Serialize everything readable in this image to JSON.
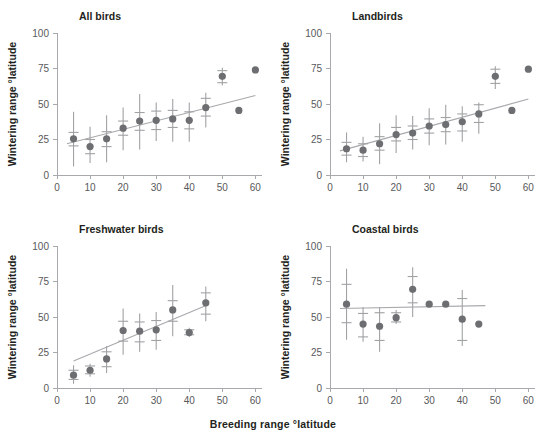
{
  "figure": {
    "x_axis_caption": "Breeding range °latitude",
    "y_axis_caption": "Wintering range °latitude",
    "marker_color": "#6d6e71",
    "errorbar_color": "#a0a2a4",
    "trendline_color": "#a7a9ac",
    "axis_color": "#a7a9ac"
  },
  "axes": {
    "x_ticks": [
      0,
      10,
      20,
      30,
      40,
      50,
      60
    ],
    "y_ticks": [
      0,
      25,
      50,
      75,
      100
    ],
    "xlim": [
      0,
      62
    ],
    "ylim": [
      0,
      100
    ],
    "grid": false
  },
  "chart_data": [
    {
      "type": "scatter",
      "title": "All birds",
      "xlabel": "Breeding range °latitude",
      "ylabel": "Wintering range °latitude",
      "xlim": [
        0,
        62
      ],
      "ylim": [
        0,
        100
      ],
      "x_ticks": [
        0,
        10,
        20,
        30,
        40,
        50,
        60
      ],
      "y_ticks": [
        0,
        25,
        50,
        75,
        100
      ],
      "grid": false,
      "legend": "none",
      "x": [
        5,
        10,
        15,
        20,
        25,
        30,
        35,
        40,
        45,
        50,
        55,
        60
      ],
      "y": [
        25.5,
        20.0,
        25.5,
        33.0,
        38.0,
        38.5,
        39.5,
        38.5,
        47.5,
        69.5,
        45.5,
        74.0
      ],
      "err_low": [
        6.0,
        8.5,
        9.0,
        17.5,
        18.0,
        24.0,
        23.5,
        23.5,
        33.5,
        63.0,
        null,
        null
      ],
      "err_high": [
        44.5,
        34.0,
        42.0,
        47.5,
        57.0,
        51.0,
        53.5,
        51.0,
        58.0,
        75.5,
        null,
        null
      ],
      "cap_low": [
        20.5,
        15.0,
        20.0,
        28.0,
        31.5,
        32.0,
        33.5,
        32.5,
        41.5,
        65.0,
        null,
        null
      ],
      "cap_high": [
        30.0,
        25.0,
        30.5,
        38.0,
        44.0,
        45.0,
        45.5,
        44.5,
        54.0,
        73.5,
        null,
        null
      ],
      "trendline": {
        "x0": 3.0,
        "y0": 22.0,
        "x1": 60.0,
        "y1": 56.0
      }
    },
    {
      "type": "scatter",
      "title": "Landbirds",
      "xlabel": "Breeding range °latitude",
      "ylabel": "Wintering range °latitude",
      "xlim": [
        0,
        62
      ],
      "ylim": [
        0,
        100
      ],
      "x_ticks": [
        0,
        10,
        20,
        30,
        40,
        50,
        60
      ],
      "y_ticks": [
        0,
        25,
        50,
        75,
        100
      ],
      "grid": false,
      "legend": "none",
      "x": [
        5,
        10,
        15,
        20,
        25,
        30,
        35,
        40,
        45,
        50,
        55,
        60
      ],
      "y": [
        18.5,
        17.5,
        22.0,
        28.5,
        29.5,
        34.5,
        35.5,
        37.5,
        43.0,
        69.5,
        45.5,
        74.5
      ],
      "err_low": [
        9.0,
        9.5,
        7.5,
        15.5,
        18.0,
        21.0,
        21.5,
        23.5,
        29.0,
        60.5,
        null,
        null
      ],
      "err_high": [
        30.0,
        27.0,
        36.5,
        42.0,
        41.5,
        47.0,
        49.5,
        48.5,
        51.0,
        76.5,
        null,
        null
      ],
      "cap_low": [
        14.0,
        13.0,
        17.5,
        24.0,
        25.0,
        29.5,
        30.5,
        31.0,
        37.0,
        64.5,
        null,
        null
      ],
      "cap_high": [
        23.0,
        22.0,
        27.0,
        33.5,
        34.5,
        39.5,
        40.5,
        43.0,
        49.5,
        74.5,
        null,
        null
      ],
      "trendline": {
        "x0": 3.0,
        "y0": 17.0,
        "x1": 60.0,
        "y1": 53.5
      }
    },
    {
      "type": "scatter",
      "title": "Freshwater birds",
      "xlabel": "Breeding range °latitude",
      "ylabel": "Wintering range °latitude",
      "xlim": [
        0,
        62
      ],
      "ylim": [
        0,
        100
      ],
      "x_ticks": [
        0,
        10,
        20,
        30,
        40,
        50,
        60
      ],
      "y_ticks": [
        0,
        25,
        50,
        75,
        100
      ],
      "grid": false,
      "legend": "none",
      "x": [
        5,
        10,
        15,
        20,
        25,
        30,
        35,
        40,
        45
      ],
      "y": [
        9.0,
        12.5,
        20.5,
        40.5,
        40.0,
        41.0,
        55.0,
        39.0,
        60.0
      ],
      "err_low": [
        3.0,
        8.0,
        10.5,
        23.5,
        25.5,
        27.0,
        36.5,
        36.0,
        47.0
      ],
      "err_high": [
        16.0,
        17.0,
        29.5,
        56.0,
        52.5,
        53.5,
        72.5,
        42.5,
        71.5
      ],
      "cap_low": [
        6.0,
        10.0,
        15.0,
        33.0,
        32.5,
        33.5,
        47.0,
        37.5,
        52.0
      ],
      "cap_high": [
        12.5,
        15.5,
        25.5,
        47.0,
        46.5,
        47.5,
        61.5,
        41.0,
        67.0
      ],
      "trendline": {
        "x0": 5.0,
        "y0": 19.0,
        "x1": 46.0,
        "y1": 59.0
      }
    },
    {
      "type": "scatter",
      "title": "Coastal birds",
      "xlabel": "Breeding range °latitude",
      "ylabel": "Wintering range °latitude",
      "xlim": [
        0,
        62
      ],
      "ylim": [
        0,
        100
      ],
      "x_ticks": [
        0,
        10,
        20,
        30,
        40,
        50,
        60
      ],
      "y_ticks": [
        0,
        25,
        50,
        75,
        100
      ],
      "grid": false,
      "legend": "none",
      "x": [
        5,
        10,
        15,
        20,
        25,
        30,
        35,
        40,
        45
      ],
      "y": [
        59.0,
        45.0,
        43.5,
        49.5,
        69.5,
        59.0,
        59.0,
        48.5,
        45.0
      ],
      "err_low": [
        34.0,
        32.5,
        25.5,
        45.0,
        50.0,
        null,
        null,
        29.5,
        null
      ],
      "err_high": [
        84.0,
        57.0,
        57.0,
        55.0,
        85.0,
        null,
        null,
        69.0,
        null
      ],
      "cap_low": [
        46.0,
        36.0,
        33.5,
        46.5,
        60.0,
        null,
        null,
        33.5,
        null
      ],
      "cap_high": [
        73.0,
        52.5,
        53.0,
        53.0,
        78.5,
        null,
        null,
        63.0,
        null
      ],
      "trendline": {
        "x0": 3.0,
        "y0": 56.0,
        "x1": 47.0,
        "y1": 58.0
      }
    }
  ]
}
